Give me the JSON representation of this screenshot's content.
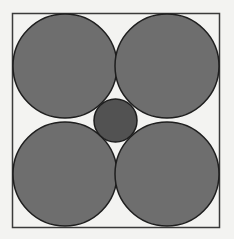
{
  "diagram": {
    "title": "",
    "background": "#f3f3f1",
    "square": {
      "x": 12.5,
      "y": 13.5,
      "width": 207,
      "height": 214,
      "stroke": "#3a3a3a",
      "stroke_width": 1.5,
      "fill": "#f3f3f1"
    },
    "large_circles": [
      {
        "id": "top-left",
        "cx": 65,
        "cy": 66,
        "r": 52,
        "fill": "#6e6e6e",
        "stroke": "#1e1e1e"
      },
      {
        "id": "top-right",
        "cx": 167,
        "cy": 66,
        "r": 52,
        "fill": "#6e6e6e",
        "stroke": "#1e1e1e"
      },
      {
        "id": "bottom-left",
        "cx": 65,
        "cy": 174,
        "r": 52,
        "fill": "#6e6e6e",
        "stroke": "#1e1e1e"
      },
      {
        "id": "bottom-right",
        "cx": 167,
        "cy": 174,
        "r": 52,
        "fill": "#6e6e6e",
        "stroke": "#1e1e1e"
      }
    ],
    "small_circle": {
      "id": "center",
      "cx": 115.5,
      "cy": 120.5,
      "r": 21.5,
      "fill": "#525252",
      "stroke": "#1e1e1e"
    }
  }
}
